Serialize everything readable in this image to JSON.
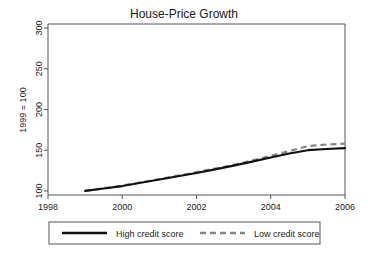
{
  "chart_data": {
    "type": "line",
    "title": "House-Price Growth",
    "xlabel": "",
    "ylabel": "1999 = 100",
    "xlim": [
      1998,
      2006
    ],
    "ylim": [
      95,
      305
    ],
    "xticks": [
      1998,
      2000,
      2002,
      2004,
      2006
    ],
    "yticks": [
      100,
      150,
      200,
      250,
      300
    ],
    "xtick_labels": [
      "1998",
      "2000",
      "2002",
      "2004",
      "2006"
    ],
    "ytick_labels": [
      "100",
      "150",
      "200",
      "250",
      "300"
    ],
    "grid": false,
    "legend_position": "below",
    "x": [
      1999,
      1999.5,
      2000,
      2000.5,
      2001,
      2001.5,
      2002,
      2002.5,
      2003,
      2003.5,
      2004,
      2004.5,
      2005,
      2005.5,
      2006
    ],
    "series": [
      {
        "name": "High credit score",
        "style": "solid",
        "color": "#111111",
        "values": [
          100,
          103,
          106,
          110,
          114,
          118,
          122,
          126.5,
          131,
          136,
          141,
          146,
          150,
          151.5,
          152.5
        ]
      },
      {
        "name": "Low credit score",
        "style": "dashed",
        "color": "#858585",
        "values": [
          100,
          103.2,
          106.5,
          110.5,
          114.5,
          118.8,
          123,
          127.5,
          132,
          137.5,
          143,
          149,
          155,
          157,
          158
        ]
      }
    ]
  },
  "legend": {
    "items": [
      {
        "label": "High credit score"
      },
      {
        "label": "Low credit score"
      }
    ]
  },
  "colors": {
    "high_credit": "#111111",
    "low_credit": "#858585",
    "axis": "#555555",
    "background": "#ffffff"
  }
}
